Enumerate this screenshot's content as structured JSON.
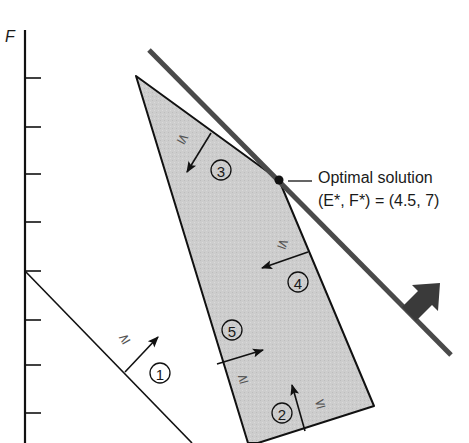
{
  "axis": {
    "label": "F",
    "ticks_count": 8
  },
  "constraints": [
    {
      "id": "1",
      "number_label": "1",
      "relation": "≥"
    },
    {
      "id": "2",
      "number_label": "2",
      "relation": "≤"
    },
    {
      "id": "3",
      "number_label": "3",
      "relation": "≤"
    },
    {
      "id": "4",
      "number_label": "4",
      "relation": "≤"
    },
    {
      "id": "5",
      "number_label": "5",
      "relation": "≥"
    }
  ],
  "optimal": {
    "title": "Optimal solution",
    "value": "(E*, F*) = (4.5, 7)",
    "E": 4.5,
    "F": 7
  },
  "colors": {
    "feasible_region": "#cfcfcf",
    "objective_line": "#4a4a4a",
    "ink": "#111111"
  }
}
